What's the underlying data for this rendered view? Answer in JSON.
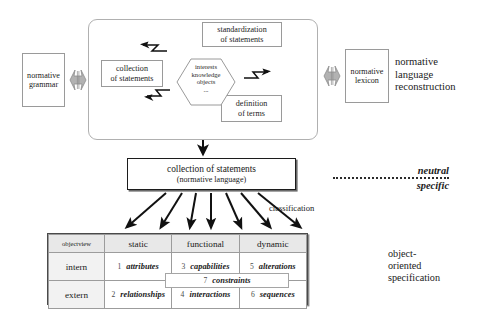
{
  "diagram": {
    "sides": {
      "grammar_box": "normative\ngrammar",
      "lexicon_box": "normative\nlexicon",
      "reconstruction_label": "normative\nlanguage\nreconstruction",
      "oo_spec_label": "object-\noriented\nspecification"
    },
    "cycle": {
      "standardization": "standardization\nof statements",
      "collection": "collection\nof statements",
      "definition": "definition\nof terms",
      "hexagon": "interests\nknowledge\nobjects\n..."
    },
    "result_box": {
      "line1": "collection of statements",
      "line2": "(normative language)"
    },
    "classification_label": "classification",
    "axis": {
      "neutral": "neutral",
      "specific": "specific"
    },
    "icons": {
      "bowtie_grammar": "double-headed-arrow-icon",
      "bowtie_lexicon": "double-headed-arrow-icon",
      "zigzag_left_upper": "zigzag-arrow-left-icon",
      "zigzag_left_lower": "zigzag-arrow-left-icon",
      "zigzag_right": "zigzag-arrow-right-icon",
      "cycle_upper": "curved-arrow-counterclockwise-icon",
      "cycle_lower": "curved-arrow-clockwise-icon",
      "down_arrow": "arrow-down-icon",
      "fan_arrows": "fan-of-arrows-icon"
    },
    "colors": {
      "ink": "#1a1a1a",
      "box_border": "#9a9a9a",
      "strong_border": "#1c1c1c",
      "header_fill": "#e8e8e8",
      "bowtie_fill": "#a8a8a8",
      "dotted_rule": "#2b2b2b"
    },
    "table": {
      "corner_label": "objectview",
      "columns": [
        "static",
        "functional",
        "dynamic"
      ],
      "rows": [
        {
          "label": "intern",
          "cells": [
            {
              "num": "1",
              "term": "attributes"
            },
            {
              "num": "3",
              "term": "capabilities"
            },
            {
              "num": "5",
              "term": "alterations"
            }
          ]
        },
        {
          "label": "extern",
          "cells": [
            {
              "num": "2",
              "term": "relationships"
            },
            {
              "num": "4",
              "term": "interactions"
            },
            {
              "num": "6",
              "term": "sequences"
            }
          ]
        }
      ],
      "overlay": {
        "num": "7",
        "term": "constraints"
      }
    }
  }
}
